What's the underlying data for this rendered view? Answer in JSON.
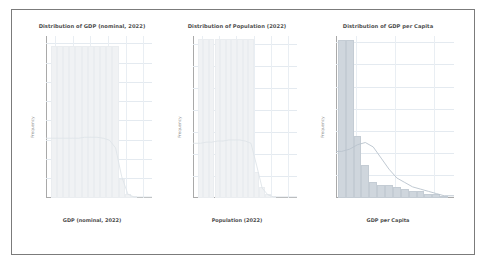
{
  "figure": {
    "background_color": "#ffffff",
    "frame_color": "#7b7b7b",
    "bar_color": "#cfd6dd",
    "kde_color": "#b9c3cd",
    "grid_color": "#e4eaf0"
  },
  "chart_data": [
    {
      "type": "bar",
      "title": "Distribution of GDP (nominal, 2022)",
      "xlabel": "GDP (nominal, 2022)",
      "ylabel": "Frequency",
      "xscale": "log",
      "xticks": [
        "10⁷",
        "10⁸",
        "10⁹",
        "10¹⁰",
        "10¹¹",
        "10¹²"
      ],
      "yticks": [
        0,
        20,
        40,
        60,
        80,
        100,
        120,
        140,
        160
      ],
      "ylim": [
        0,
        168
      ],
      "grid": true,
      "legend": "none",
      "categories": [
        "10^7",
        "10^7.4",
        "10^7.8",
        "10^8.2",
        "10^8.6",
        "10^9",
        "10^9.4",
        "10^9.8",
        "10^10.2",
        "10^10.6",
        "10^11",
        "10^11.4",
        "10^11.8",
        "10^12.2"
      ],
      "values": [
        158,
        158,
        158,
        158,
        158,
        158,
        158,
        158,
        158,
        158,
        158,
        20,
        4,
        1
      ],
      "kde_values": [
        62,
        62,
        62,
        62,
        62,
        63,
        63,
        63,
        62,
        60,
        52,
        22,
        4,
        1
      ],
      "annotations": []
    },
    {
      "type": "bar",
      "title": "Distribution of Population (2022)",
      "xlabel": "Population (2022)",
      "ylabel": "Frequency",
      "xscale": "log",
      "xticks": [
        "10⁴",
        "10⁵",
        "10⁶",
        "10⁷",
        "10⁸",
        "10⁹"
      ],
      "yticks": [
        0,
        20,
        40,
        60,
        80,
        100,
        120,
        140
      ],
      "ylim": [
        0,
        148
      ],
      "grid": true,
      "legend": "none",
      "categories": [
        "10^4",
        "10^4.4",
        "10^4.8",
        "10^5.2",
        "10^5.6",
        "10^6",
        "10^6.4",
        "10^6.8",
        "10^7.2",
        "10^7.6",
        "10^8",
        "10^8.4",
        "10^8.8",
        "10^9.2"
      ],
      "values": [
        145,
        145,
        145,
        145,
        145,
        145,
        145,
        145,
        145,
        145,
        24,
        10,
        4,
        1
      ],
      "kde_values": [
        50,
        51,
        51,
        52,
        52,
        53,
        53,
        53,
        52,
        50,
        30,
        9,
        3,
        1
      ],
      "annotations": []
    },
    {
      "type": "bar",
      "title": "Distribution of GDP per Capita",
      "xlabel": "GDP per Capita",
      "ylabel": "Frequency",
      "xscale": "log",
      "xticks": [
        "10⁴",
        "10⁵",
        "10⁶"
      ],
      "yticks": [
        0,
        10,
        20,
        30,
        40,
        50,
        60,
        70
      ],
      "ylim": [
        0,
        73
      ],
      "grid": true,
      "legend": "none",
      "categories": [
        "10^3.0",
        "10^3.6",
        "10^4.2",
        "10^4.5",
        "10^4.7",
        "10^4.9",
        "10^5.1",
        "10^5.3",
        "10^5.5",
        "10^5.7",
        "10^5.9",
        "10^6.1",
        "10^6.3",
        "10^6.5"
      ],
      "values": [
        71,
        71,
        28,
        15,
        7,
        6,
        6,
        5,
        4,
        3,
        3,
        2,
        2,
        1
      ],
      "kde_values": [
        21,
        22,
        24,
        25,
        23,
        18,
        13,
        9,
        7,
        5,
        4,
        3,
        2,
        1
      ],
      "annotations": []
    }
  ]
}
